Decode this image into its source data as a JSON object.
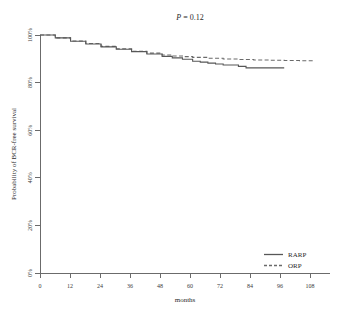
{
  "chart_data": {
    "type": "line",
    "title_statistic": "P",
    "title_operator": "=",
    "title_value": "0.12",
    "xlabel": "months",
    "ylabel": "Probability of BCR-free survival",
    "xlim": [
      0,
      114
    ],
    "ylim": [
      0,
      100
    ],
    "grid": false,
    "legend_position": "bottom-right",
    "x_ticks": [
      0,
      12,
      24,
      36,
      48,
      60,
      72,
      84,
      96,
      108
    ],
    "x_tick_labels": [
      "0",
      "12",
      "24",
      "36",
      "48",
      "60",
      "72",
      "84",
      "96",
      "108"
    ],
    "y_ticks": [
      0,
      20,
      40,
      60,
      80,
      100
    ],
    "y_tick_labels": [
      "0%",
      "20%",
      "40%",
      "60%",
      "80%",
      "100%"
    ],
    "series": [
      {
        "name": "RARP",
        "style": "solid",
        "color": "#575757",
        "x": [
          0,
          6,
          12,
          18,
          24,
          30,
          36,
          42,
          48,
          52,
          56,
          60,
          63,
          66,
          69,
          72,
          75,
          78,
          81,
          84,
          90,
          96
        ],
        "values": [
          100,
          98.8,
          97.4,
          96.2,
          95.0,
          94.0,
          93.0,
          92.0,
          91.0,
          90.4,
          89.8,
          89.0,
          88.6,
          88.2,
          87.8,
          87.4,
          87.4,
          86.8,
          86.2,
          86.2,
          86.2,
          86.2
        ]
      },
      {
        "name": "ORP",
        "style": "dashed",
        "color": "#6a6a6a",
        "x": [
          0,
          6,
          12,
          18,
          24,
          30,
          36,
          42,
          48,
          52,
          56,
          60,
          66,
          72,
          78,
          84,
          90,
          96,
          102,
          108
        ],
        "values": [
          100,
          98.8,
          97.5,
          96.4,
          95.2,
          94.2,
          93.2,
          92.4,
          91.6,
          91.2,
          90.9,
          90.6,
          90.2,
          89.9,
          89.7,
          89.5,
          89.4,
          89.3,
          89.2,
          89.1
        ]
      }
    ],
    "legend_entries": [
      {
        "label": "RARP",
        "style": "solid"
      },
      {
        "label": "ORP",
        "style": "dashed"
      }
    ]
  }
}
